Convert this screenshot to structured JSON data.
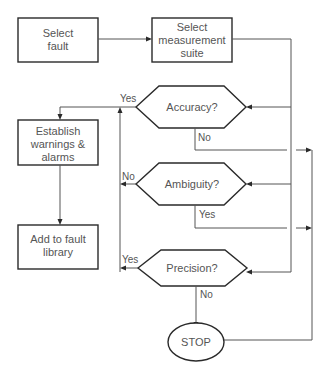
{
  "diagram": {
    "type": "flowchart",
    "nodes": {
      "select_fault": {
        "line1": "Select",
        "line2": "fault"
      },
      "select_suite": {
        "line1": "Select",
        "line2": "measurement",
        "line3": "suite"
      },
      "accuracy": {
        "label": "Accuracy?"
      },
      "ambiguity": {
        "label": "Ambiguity?"
      },
      "precision": {
        "label": "Precision?"
      },
      "establish": {
        "line1": "Establish",
        "line2": "warnings &",
        "line3": "alarms"
      },
      "add_library": {
        "line1": "Add to fault",
        "line2": "library"
      },
      "stop": {
        "label": "STOP"
      }
    },
    "edge_labels": {
      "accuracy_yes": "Yes",
      "accuracy_no": "No",
      "ambiguity_no": "No",
      "ambiguity_yes": "Yes",
      "precision_yes": "Yes",
      "precision_no": "No"
    },
    "edges": [
      {
        "from": "Select fault",
        "to": "Select measurement suite"
      },
      {
        "from": "Select measurement suite",
        "to": "Accuracy?"
      },
      {
        "from": "Select measurement suite",
        "to": "Ambiguity?"
      },
      {
        "from": "Select measurement suite",
        "to": "Precision?"
      },
      {
        "from": "Accuracy?",
        "to": "Establish warnings & alarms",
        "label": "Yes"
      },
      {
        "from": "Accuracy?",
        "to": "STOP",
        "label": "No"
      },
      {
        "from": "Ambiguity?",
        "to": "Establish warnings & alarms",
        "label": "No"
      },
      {
        "from": "Ambiguity?",
        "to": "STOP",
        "label": "Yes"
      },
      {
        "from": "Precision?",
        "to": "Establish warnings & alarms",
        "label": "Yes"
      },
      {
        "from": "Precision?",
        "to": "STOP",
        "label": "No"
      },
      {
        "from": "Establish warnings & alarms",
        "to": "Add to fault library"
      }
    ]
  }
}
